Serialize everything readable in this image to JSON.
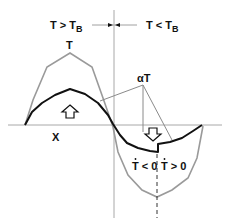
{
  "diagram": {
    "top_labels": {
      "left": {
        "main": "T > T",
        "sub": "B"
      },
      "right": {
        "main": "T < T",
        "sub": "B"
      }
    },
    "curve_labels": {
      "total": "T",
      "scaled": "αT"
    },
    "axis_label_x": "X",
    "rate_labels": {
      "left": {
        "main": "T < 0",
        "dot_over": "T"
      },
      "right": {
        "main": "T > 0",
        "dot_over": "T"
      }
    },
    "arrows": {
      "up": "up-arrow",
      "down": "down-arrow"
    },
    "colors": {
      "total_curve": "#9a9a9a",
      "scaled_curve": "#111111",
      "axes": "#a0a0a0",
      "text": "#111111"
    }
  }
}
